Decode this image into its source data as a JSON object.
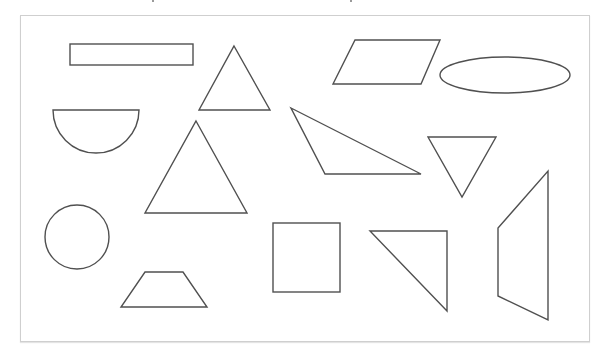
{
  "diagram": {
    "stroke_color": "#505050",
    "frame_border_color": "#cfcfcf",
    "background": "#ffffff",
    "shapes": [
      {
        "name": "rectangle",
        "type": "rect",
        "x": 70,
        "y": 44,
        "w": 123,
        "h": 21
      },
      {
        "name": "small-triangle",
        "type": "polygon",
        "points": "234,46 270,110 199,110"
      },
      {
        "name": "parallelogram",
        "type": "polygon",
        "points": "355,40 440,40 421,84 333,84"
      },
      {
        "name": "ellipse",
        "type": "ellipse",
        "cx": 505,
        "cy": 75,
        "rx": 65,
        "ry": 18
      },
      {
        "name": "semicircle",
        "type": "path",
        "d": "M53,110 L139,110 A43,43 0 0 1 53,110 Z"
      },
      {
        "name": "large-triangle",
        "type": "polygon",
        "points": "196,121 247,213 145,213"
      },
      {
        "name": "obtuse-triangle",
        "type": "polygon",
        "points": "291,108 421,174 325,174"
      },
      {
        "name": "inverted-triangle",
        "type": "polygon",
        "points": "428,137 496,137 462,197"
      },
      {
        "name": "circle",
        "type": "circle",
        "cx": 77,
        "cy": 237,
        "r": 32
      },
      {
        "name": "trapezoid",
        "type": "polygon",
        "points": "145,272 183,272 207,307 121,307"
      },
      {
        "name": "square",
        "type": "rect",
        "x": 273,
        "y": 223,
        "w": 67,
        "h": 69
      },
      {
        "name": "right-triangle",
        "type": "polygon",
        "points": "370,231 447,231 447,311"
      },
      {
        "name": "irregular-quadrilateral",
        "type": "polygon",
        "points": "548,171 548,320 498,296 498,228"
      }
    ]
  }
}
